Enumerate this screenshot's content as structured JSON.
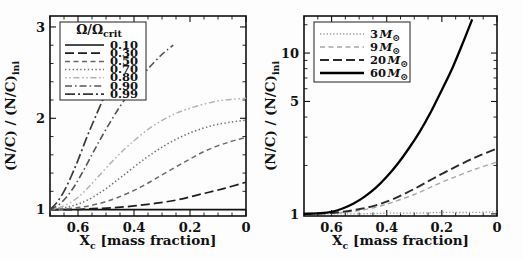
{
  "figure": {
    "panels": [
      "left",
      "right"
    ],
    "background": "#fdfdfd"
  },
  "chart_data": [
    {
      "type": "line",
      "panel": "left",
      "title": "",
      "xlabel": "X_c [mass fraction]",
      "ylabel": "(N/C) / (N/C)_ini",
      "xlabel_main": "X",
      "xlabel_sub": "c",
      "xlabel_rest": " [mass fraction]",
      "xlim": [
        0.7,
        0.0
      ],
      "ylim": [
        0.93,
        3.12
      ],
      "yscale": "linear",
      "xscale": "linear",
      "x_reversed": true,
      "grid": false,
      "xticks": [
        0.6,
        0.4,
        0.2,
        0
      ],
      "xticklabels": [
        "0.6",
        "0.4",
        "0.2",
        "0"
      ],
      "yticks": [
        1,
        2,
        3
      ],
      "yticklabels": [
        "1",
        "2",
        "3"
      ],
      "legend_position": "upper-left",
      "legend_title": "Ω/Ω",
      "legend_title_sub": "crit",
      "series": [
        {
          "name": "0.10",
          "label": "0.10",
          "dash": "solid",
          "color": "#111111",
          "width": 1.7,
          "x": [
            0.7,
            0.6,
            0.5,
            0.4,
            0.3,
            0.2,
            0.1,
            0.0
          ],
          "values": [
            1.0,
            1.0,
            1.0,
            1.0,
            1.0,
            1.0,
            1.0,
            1.0
          ]
        },
        {
          "name": "0.30",
          "label": "0.30",
          "dash": "longdash",
          "color": "#1d1d1d",
          "width": 1.7,
          "x": [
            0.7,
            0.62,
            0.55,
            0.48,
            0.4,
            0.32,
            0.24,
            0.16,
            0.08,
            0.0
          ],
          "values": [
            1.0,
            1.0,
            1.01,
            1.02,
            1.04,
            1.07,
            1.11,
            1.17,
            1.23,
            1.3
          ]
        },
        {
          "name": "0.50",
          "label": "0.50",
          "dash": "dash",
          "color": "#6a6a6a",
          "width": 1.5,
          "x": [
            0.7,
            0.64,
            0.58,
            0.52,
            0.46,
            0.38,
            0.3,
            0.22,
            0.14,
            0.06,
            0.0
          ],
          "values": [
            1.0,
            1.01,
            1.03,
            1.07,
            1.13,
            1.24,
            1.38,
            1.52,
            1.65,
            1.74,
            1.79
          ]
        },
        {
          "name": "0.70",
          "label": "0.70",
          "dash": "dot",
          "color": "#6f6f6f",
          "width": 1.5,
          "x": [
            0.7,
            0.65,
            0.6,
            0.55,
            0.5,
            0.44,
            0.36,
            0.28,
            0.2,
            0.12,
            0.05,
            0.0
          ],
          "values": [
            1.0,
            1.02,
            1.06,
            1.13,
            1.23,
            1.37,
            1.56,
            1.72,
            1.84,
            1.92,
            1.96,
            1.98
          ]
        },
        {
          "name": "0.80",
          "label": "0.80",
          "dash": "dashdotdot",
          "color": "#b3b3b3",
          "width": 1.5,
          "x": [
            0.7,
            0.66,
            0.62,
            0.58,
            0.54,
            0.48,
            0.42,
            0.34,
            0.26,
            0.18,
            0.1,
            0.04,
            0.0
          ],
          "values": [
            1.0,
            1.03,
            1.09,
            1.19,
            1.32,
            1.52,
            1.7,
            1.9,
            2.04,
            2.13,
            2.19,
            2.21,
            2.22
          ]
        },
        {
          "name": "0.90",
          "label": "0.90",
          "dash": "dashdot",
          "color": "#555555",
          "width": 1.6,
          "x": [
            0.7,
            0.67,
            0.64,
            0.61,
            0.58,
            0.54,
            0.5,
            0.45,
            0.4,
            0.35,
            0.3,
            0.26
          ],
          "values": [
            1.0,
            1.05,
            1.14,
            1.27,
            1.43,
            1.66,
            1.88,
            2.13,
            2.35,
            2.54,
            2.7,
            2.8
          ]
        },
        {
          "name": "0.99",
          "label": "0.99",
          "dash": "dashdot-long",
          "color": "#3a3a3a",
          "width": 1.7,
          "x": [
            0.7,
            0.675,
            0.65,
            0.625,
            0.6,
            0.57,
            0.54,
            0.5,
            0.46,
            0.42,
            0.385
          ],
          "values": [
            1.0,
            1.08,
            1.2,
            1.36,
            1.54,
            1.78,
            2.0,
            2.28,
            2.53,
            2.74,
            2.88
          ]
        }
      ]
    },
    {
      "type": "line",
      "panel": "right",
      "title": "",
      "xlabel": "X_c [mass fraction]",
      "ylabel": "(N/C) / (N/C)_ini",
      "xlabel_main": "X",
      "xlabel_sub": "c",
      "xlabel_rest": " [mass fraction]",
      "xlim": [
        0.7,
        0.0
      ],
      "ylim": [
        0.97,
        17.0
      ],
      "yscale": "log",
      "xscale": "linear",
      "x_reversed": true,
      "grid": false,
      "xticks": [
        0.6,
        0.4,
        0.2,
        0
      ],
      "xticklabels": [
        "0.6",
        "0.4",
        "0.2",
        "0"
      ],
      "yticks": [
        1,
        5,
        10
      ],
      "yticklabels": [
        "1",
        "5",
        "10"
      ],
      "yticks_minor": [
        2,
        3,
        4,
        6,
        7,
        8,
        9,
        15
      ],
      "legend_position": "upper-left",
      "legend_title": "",
      "series": [
        {
          "name": "3 Msun",
          "label": "3",
          "label_unit": "M",
          "label_sub": "⊙",
          "dash": "dotdash-fine",
          "color": "#9b9b9b",
          "width": 1.3,
          "x": [
            0.7,
            0.6,
            0.5,
            0.4,
            0.3,
            0.2,
            0.1,
            0.0
          ],
          "values": [
            1.0,
            1.0,
            1.0,
            1.01,
            1.01,
            1.02,
            1.02,
            1.03
          ]
        },
        {
          "name": "9 Msun",
          "label": "9",
          "label_unit": "M",
          "label_sub": "⊙",
          "dash": "dash",
          "color": "#a8a8a8",
          "width": 1.4,
          "x": [
            0.7,
            0.62,
            0.56,
            0.5,
            0.44,
            0.38,
            0.3,
            0.22,
            0.14,
            0.07,
            0.0
          ],
          "values": [
            1.0,
            1.01,
            1.02,
            1.05,
            1.1,
            1.18,
            1.32,
            1.52,
            1.73,
            1.92,
            2.1
          ]
        },
        {
          "name": "20 Msun",
          "label": "20",
          "label_unit": "M",
          "label_sub": "⊙",
          "dash": "longdash",
          "color": "#2a2a2a",
          "width": 1.9,
          "x": [
            0.7,
            0.62,
            0.56,
            0.5,
            0.44,
            0.38,
            0.3,
            0.22,
            0.14,
            0.07,
            0.0
          ],
          "values": [
            1.0,
            1.01,
            1.03,
            1.07,
            1.13,
            1.23,
            1.43,
            1.7,
            2.0,
            2.28,
            2.55
          ]
        },
        {
          "name": "60 Msun",
          "label": "60",
          "label_unit": "M",
          "label_sub": "⊙",
          "dash": "solid",
          "color": "#000000",
          "width": 2.3,
          "x": [
            0.7,
            0.64,
            0.6,
            0.56,
            0.52,
            0.48,
            0.44,
            0.4,
            0.36,
            0.32,
            0.28,
            0.24,
            0.2,
            0.16,
            0.12,
            0.09
          ],
          "values": [
            1.0,
            1.01,
            1.03,
            1.08,
            1.16,
            1.28,
            1.45,
            1.7,
            2.05,
            2.55,
            3.25,
            4.3,
            5.9,
            8.2,
            12.0,
            16.2
          ]
        }
      ]
    }
  ]
}
